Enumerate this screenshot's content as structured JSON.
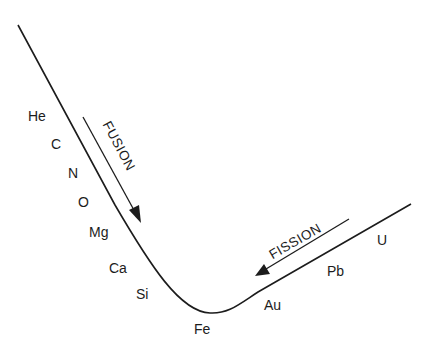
{
  "diagram": {
    "type": "binding-energy-curve",
    "colors": {
      "line": "#1c1c1c",
      "background": "#ffffff"
    },
    "processes": [
      {
        "label": "FUSION",
        "direction": "down-right"
      },
      {
        "label": "FISSION",
        "direction": "down-left"
      }
    ],
    "elements": [
      {
        "symbol": "He"
      },
      {
        "symbol": "C"
      },
      {
        "symbol": "N"
      },
      {
        "symbol": "O"
      },
      {
        "symbol": "Mg"
      },
      {
        "symbol": "Ca"
      },
      {
        "symbol": "Si"
      },
      {
        "symbol": "Fe"
      },
      {
        "symbol": "Au"
      },
      {
        "symbol": "Pb"
      },
      {
        "symbol": "U"
      }
    ]
  }
}
